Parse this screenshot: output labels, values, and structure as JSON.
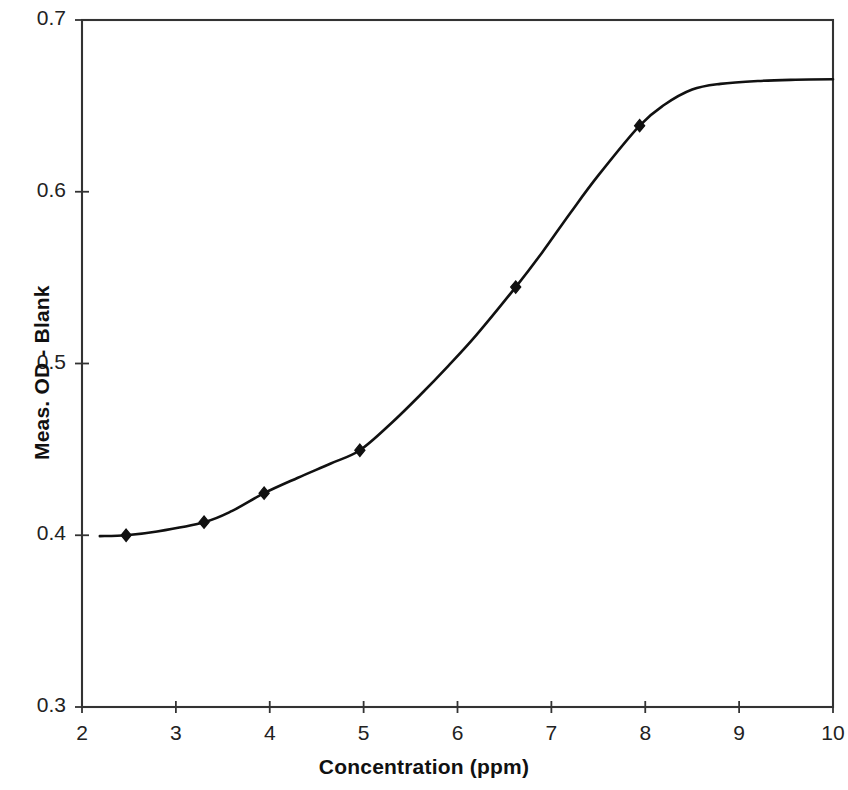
{
  "chart_data": {
    "type": "line",
    "title": "",
    "subtitle": "",
    "xlabel": "Concentration (ppm)",
    "ylabel": "Meas. OD - Blank",
    "xlim": [
      2,
      10
    ],
    "ylim": [
      0.3,
      0.7
    ],
    "xticks": [
      2,
      3,
      4,
      5,
      6,
      7,
      8,
      9,
      10
    ],
    "xtick_labels": [
      "2",
      "3",
      "4",
      "5",
      "6",
      "7",
      "8",
      "9",
      "10"
    ],
    "yticks": [
      0.3,
      0.4,
      0.5,
      0.6,
      0.7
    ],
    "ytick_labels": [
      "0.3",
      "0.4",
      "0.5",
      "0.6",
      "0.7"
    ],
    "grid": false,
    "legend": null,
    "legend_position": "none",
    "series": [
      {
        "name": "Meas. OD - Blank",
        "marker": "diamond",
        "marker_color": "#111111",
        "line_color": "#111111",
        "points": [
          {
            "x": 2.47,
            "y": 0.4
          },
          {
            "x": 3.3,
            "y": 0.4076
          },
          {
            "x": 3.94,
            "y": 0.4245
          },
          {
            "x": 4.96,
            "y": 0.4495
          },
          {
            "x": 6.62,
            "y": 0.5445
          },
          {
            "x": 7.94,
            "y": 0.6385
          }
        ]
      },
      {
        "name": "fitted sigmoid curve",
        "marker": "none",
        "line_color": "#111111",
        "points": [
          {
            "x": 2.19,
            "y": 0.3995
          },
          {
            "x": 2.47,
            "y": 0.4
          },
          {
            "x": 2.8,
            "y": 0.4022
          },
          {
            "x": 3.3,
            "y": 0.4076
          },
          {
            "x": 3.6,
            "y": 0.4142
          },
          {
            "x": 3.94,
            "y": 0.4245
          },
          {
            "x": 4.3,
            "y": 0.4335
          },
          {
            "x": 4.65,
            "y": 0.4418
          },
          {
            "x": 4.96,
            "y": 0.4495
          },
          {
            "x": 5.3,
            "y": 0.4655
          },
          {
            "x": 5.6,
            "y": 0.4815
          },
          {
            "x": 5.9,
            "y": 0.4985
          },
          {
            "x": 6.2,
            "y": 0.5165
          },
          {
            "x": 6.62,
            "y": 0.5445
          },
          {
            "x": 6.9,
            "y": 0.5645
          },
          {
            "x": 7.2,
            "y": 0.5875
          },
          {
            "x": 7.5,
            "y": 0.6095
          },
          {
            "x": 7.94,
            "y": 0.6385
          },
          {
            "x": 8.2,
            "y": 0.6505
          },
          {
            "x": 8.5,
            "y": 0.6595
          },
          {
            "x": 8.8,
            "y": 0.6628
          },
          {
            "x": 9.2,
            "y": 0.6645
          },
          {
            "x": 9.6,
            "y": 0.6652
          },
          {
            "x": 10,
            "y": 0.6655
          }
        ]
      }
    ]
  },
  "axes": {
    "frame_color": "#333333",
    "tick_color": "#333333"
  }
}
